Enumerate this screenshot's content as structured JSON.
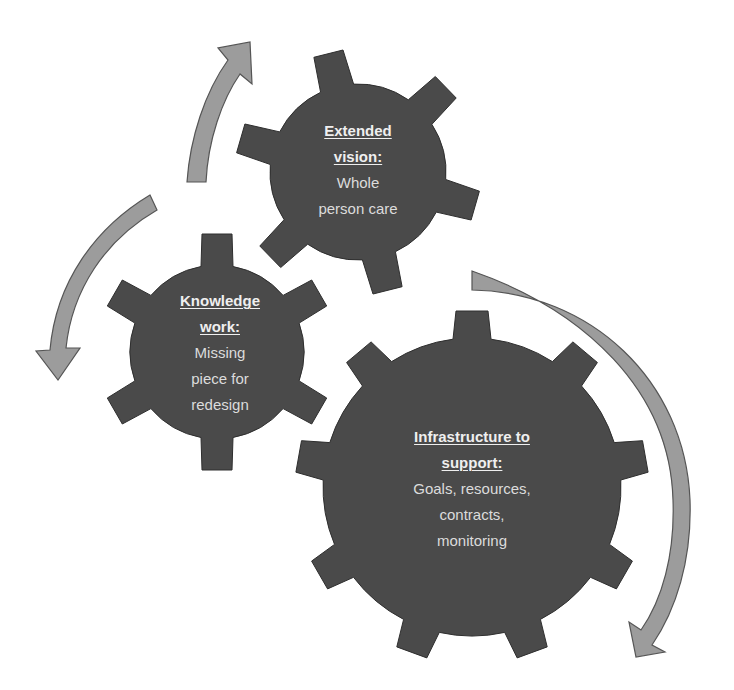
{
  "colors": {
    "background": "#ffffff",
    "gear_fill": "#4a4a4a",
    "gear_stroke": "#2e2e2e",
    "arrow_fill": "#9c9c9c",
    "arrow_stroke": "#555555",
    "heading_text": "#efefef",
    "body_text": "#dcdcdc"
  },
  "gears": [
    {
      "id": "extended-vision",
      "heading_lines": [
        "Extended",
        "vision:"
      ],
      "body_lines": [
        "Whole",
        "person care"
      ],
      "center": [
        358,
        172
      ],
      "teeth": 6,
      "tooth_start_deg": 104
    },
    {
      "id": "knowledge-work",
      "heading_lines": [
        "Knowledge",
        "work:"
      ],
      "body_lines": [
        "Missing",
        "piece for",
        "redesign"
      ],
      "center": [
        217,
        352
      ],
      "teeth": 6,
      "tooth_start_deg": 90
    },
    {
      "id": "infrastructure",
      "heading_lines": [
        "Infrastructure to",
        "support:"
      ],
      "body_lines": [
        "Goals, resources,",
        "contracts,",
        "monitoring"
      ],
      "center": [
        472,
        487
      ],
      "teeth": 9,
      "tooth_start_deg": 90
    }
  ],
  "arrows": [
    {
      "id": "arrow-up-to-extended-vision",
      "direction": "clockwise-up"
    },
    {
      "id": "arrow-down-to-knowledge-work",
      "direction": "counterclockwise-down"
    },
    {
      "id": "arrow-down-around-infrastructure",
      "direction": "clockwise-down"
    }
  ]
}
